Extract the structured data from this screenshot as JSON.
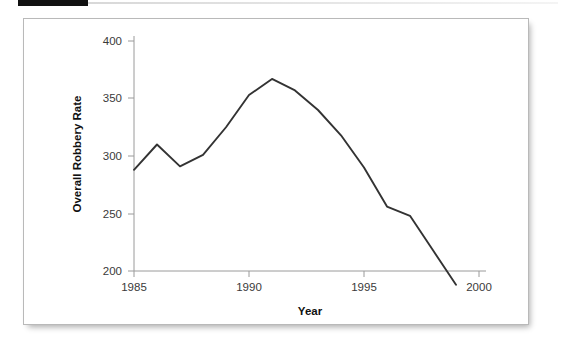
{
  "page": {
    "background_color": "#ffffff",
    "marker_bar_color": "#111111",
    "rule_color": "#dcdcdc"
  },
  "figure": {
    "border_color": "#b9b9b9",
    "background_color": "#ffffff"
  },
  "chart_data": {
    "type": "line",
    "title": "",
    "xlabel": "Year",
    "ylabel": "Overall Robbery Rate",
    "x": [
      1985,
      1986,
      1987,
      1988,
      1989,
      1990,
      1991,
      1992,
      1993,
      1994,
      1995,
      1996,
      1997,
      1998,
      1999
    ],
    "values": [
      288,
      310,
      291,
      301,
      325,
      353,
      367,
      357,
      340,
      318,
      290,
      256,
      248,
      218,
      188
    ],
    "series": [
      {
        "name": "Overall Robbery Rate",
        "color": "#333333",
        "values": [
          288,
          310,
          291,
          301,
          325,
          353,
          367,
          357,
          340,
          318,
          290,
          256,
          248,
          218,
          188
        ]
      }
    ],
    "xlim": [
      1984.3,
      2000.4
    ],
    "ylim": [
      180,
      408
    ],
    "xticks": [
      1985,
      1990,
      1995,
      2000
    ],
    "xtick_labels": [
      "1985",
      "1990",
      "1995",
      "2000"
    ],
    "yticks": [
      200,
      250,
      300,
      350,
      400
    ],
    "ytick_labels": [
      "200",
      "250",
      "300",
      "350",
      "400"
    ],
    "grid": false,
    "legend": false,
    "legend_position": "none",
    "line_color": "#333333"
  }
}
